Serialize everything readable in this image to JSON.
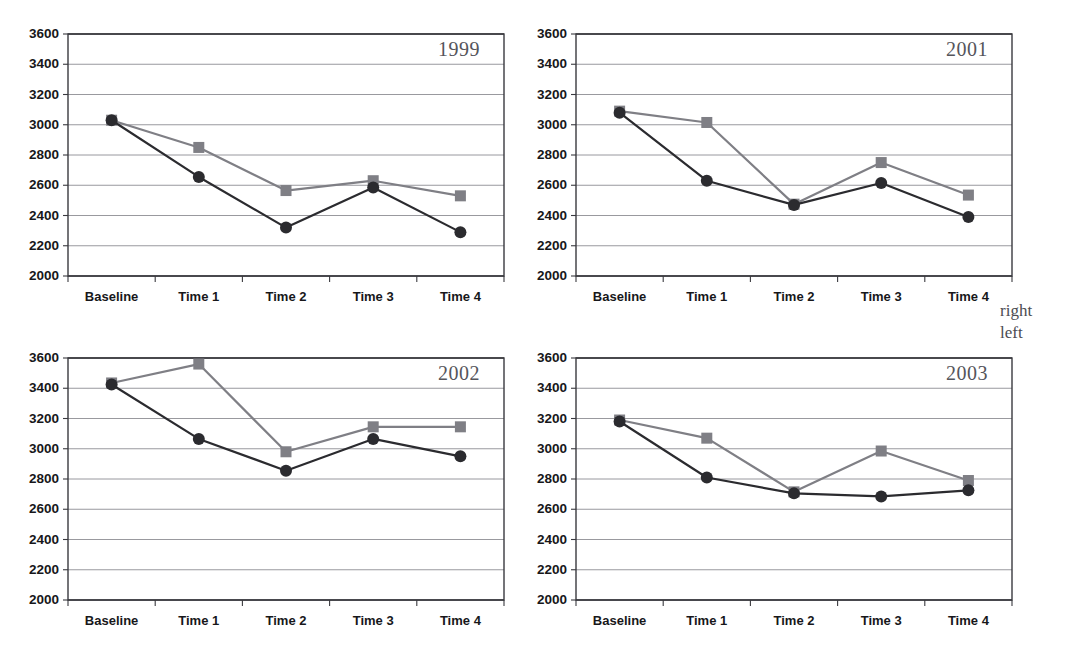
{
  "figure": {
    "ghost_text": "",
    "legend": {
      "position": "right-middle",
      "entries": [
        {
          "label": "right",
          "marker": "square",
          "color": "#7f7f85"
        },
        {
          "label": "left",
          "marker": "circle",
          "color": "#2b2b2f"
        }
      ]
    }
  },
  "chart_data": [
    {
      "type": "line",
      "title": "1999",
      "xlabel": "",
      "ylabel": "",
      "categories": [
        "Baseline",
        "Time 1",
        "Time 2",
        "Time 3",
        "Time 4"
      ],
      "yticks": [
        2000,
        2200,
        2400,
        2600,
        2800,
        3000,
        3200,
        3400,
        3600
      ],
      "ylim": [
        2000,
        3600
      ],
      "grid": true,
      "legend_position": "outside-right",
      "series": [
        {
          "name": "right",
          "marker": "square",
          "color": "#7f7f85",
          "values": [
            3030,
            2850,
            2565,
            2630,
            2530
          ]
        },
        {
          "name": "left",
          "marker": "circle",
          "color": "#2b2b2f",
          "values": [
            3030,
            2655,
            2320,
            2585,
            2290
          ]
        }
      ]
    },
    {
      "type": "line",
      "title": "2001",
      "xlabel": "",
      "ylabel": "",
      "categories": [
        "Baseline",
        "Time 1",
        "Time 2",
        "Time 3",
        "Time 4"
      ],
      "yticks": [
        2000,
        2200,
        2400,
        2600,
        2800,
        3000,
        3200,
        3400,
        3600
      ],
      "ylim": [
        2000,
        3600
      ],
      "grid": true,
      "legend_position": "outside-right",
      "series": [
        {
          "name": "right",
          "marker": "square",
          "color": "#7f7f85",
          "values": [
            3090,
            3015,
            2475,
            2750,
            2535
          ]
        },
        {
          "name": "left",
          "marker": "circle",
          "color": "#2b2b2f",
          "values": [
            3080,
            2630,
            2470,
            2615,
            2390
          ]
        }
      ]
    },
    {
      "type": "line",
      "title": "2002",
      "xlabel": "",
      "ylabel": "",
      "categories": [
        "Baseline",
        "Time 1",
        "Time 2",
        "Time 3",
        "Time 4"
      ],
      "yticks": [
        2000,
        2200,
        2400,
        2600,
        2800,
        3000,
        3200,
        3400,
        3600
      ],
      "ylim": [
        2000,
        3600
      ],
      "grid": true,
      "legend_position": "outside-right",
      "series": [
        {
          "name": "right",
          "marker": "square",
          "color": "#7f7f85",
          "values": [
            3435,
            3560,
            2980,
            3145,
            3145
          ]
        },
        {
          "name": "left",
          "marker": "circle",
          "color": "#2b2b2f",
          "values": [
            3425,
            3065,
            2855,
            3065,
            2950
          ]
        }
      ]
    },
    {
      "type": "line",
      "title": "2003",
      "xlabel": "",
      "ylabel": "",
      "categories": [
        "Baseline",
        "Time 1",
        "Time 2",
        "Time 3",
        "Time 4"
      ],
      "yticks": [
        2000,
        2200,
        2400,
        2600,
        2800,
        3000,
        3200,
        3400,
        3600
      ],
      "ylim": [
        2000,
        3600
      ],
      "grid": true,
      "legend_position": "outside-right",
      "series": [
        {
          "name": "right",
          "marker": "square",
          "color": "#7f7f85",
          "values": [
            3190,
            3070,
            2715,
            2985,
            2790
          ]
        },
        {
          "name": "left",
          "marker": "circle",
          "color": "#2b2b2f",
          "values": [
            3180,
            2810,
            2705,
            2685,
            2725
          ]
        }
      ]
    }
  ]
}
